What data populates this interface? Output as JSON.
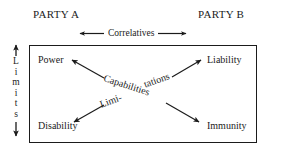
{
  "diagram": {
    "parties": {
      "left": "PARTY A",
      "right": "PARTY B"
    },
    "axes": {
      "horizontal_label": "Correlatives",
      "vertical_label": "Limits",
      "vertical_letters": [
        "L",
        "i",
        "m",
        "i",
        "t",
        "s"
      ]
    },
    "corners": {
      "top_left": "Power",
      "top_right": "Liability",
      "bottom_left": "Disability",
      "bottom_right": "Immunity"
    },
    "diagonals": {
      "descending_label": "Capabilities",
      "ascending_label_part1": "Limi-",
      "ascending_label_part2": "tations"
    },
    "colors": {
      "ink": "#1b1b1b",
      "background": "#ffffff"
    }
  }
}
